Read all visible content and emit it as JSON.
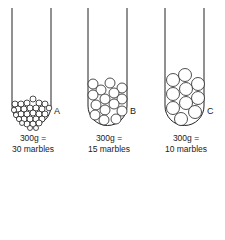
{
  "tubes": [
    {
      "id": "A",
      "label": "A",
      "mass": "300g =",
      "count": "30 marbles",
      "marble_size": "small"
    },
    {
      "id": "B",
      "label": "B",
      "mass": "300g =",
      "count": "15 marbles",
      "marble_size": "medium"
    },
    {
      "id": "C",
      "label": "C",
      "mass": "300g =",
      "count": "10 marbles",
      "marble_size": "large"
    }
  ],
  "colors": {
    "stroke": "#222222",
    "background": "#ffffff"
  }
}
